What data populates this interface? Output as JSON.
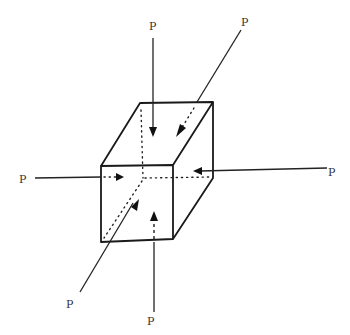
{
  "diagram": {
    "type": "cube under triaxial compressive loading",
    "colors": {
      "line": "#1a1a1a",
      "background": "#ffffff",
      "label": "#333333"
    },
    "force_labels": {
      "top": "P",
      "top_right_oblique": "P",
      "left": "P",
      "right": "P",
      "bottom_left_oblique": "P",
      "bottom": "P"
    }
  }
}
